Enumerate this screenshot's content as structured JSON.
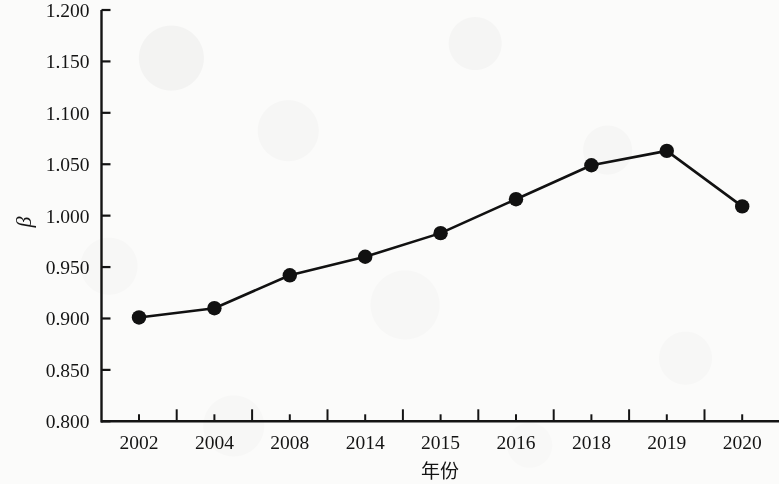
{
  "chart_data": {
    "type": "line",
    "title": "",
    "subtitle": "",
    "xlabel": "年份",
    "ylabel": "β",
    "categories": [
      "2002",
      "2004",
      "2008",
      "2014",
      "2015",
      "2016",
      "2018",
      "2019",
      "2020"
    ],
    "values": [
      0.901,
      0.91,
      0.942,
      0.96,
      0.983,
      1.016,
      1.049,
      1.063,
      1.009
    ],
    "series": [
      {
        "name": "β",
        "values": [
          0.901,
          0.91,
          0.942,
          0.96,
          0.983,
          1.016,
          1.049,
          1.063,
          1.009
        ]
      }
    ],
    "ylim": [
      0.8,
      1.2
    ],
    "y_ticks": [
      "0.800",
      "0.850",
      "0.900",
      "0.950",
      "1.000",
      "1.050",
      "1.100",
      "1.150",
      "1.200"
    ],
    "y_tick_values": [
      0.8,
      0.85,
      0.9,
      0.95,
      1.0,
      1.05,
      1.1,
      1.15,
      1.2
    ],
    "grid": false,
    "legend": false,
    "legend_position": "none",
    "marker": "filled-circle",
    "line_color": "#111111",
    "marker_color": "#111111",
    "background_color": "#fbfbfa",
    "axis_color": "#141414",
    "annotations": []
  },
  "axes": {
    "y_axis_title": "β",
    "x_axis_title": "年份"
  }
}
